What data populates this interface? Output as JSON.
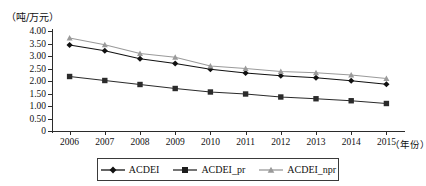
{
  "axes": {
    "y_unit_label": "（吨/万元）",
    "x_axis_label": "（年份）",
    "y_ticks": [
      "4.00",
      "3.50",
      "3.00",
      "2.50",
      "2.00",
      "1.50",
      "1.00",
      "0.50",
      "0"
    ],
    "x_ticks": [
      "2006",
      "2007",
      "2008",
      "2009",
      "2010",
      "2011",
      "2012",
      "2013",
      "2014",
      "2015"
    ]
  },
  "legend": {
    "items": [
      {
        "label": "ACDEI",
        "marker": "diamond-marker",
        "color": "#111111"
      },
      {
        "label": "ACDEI_pr",
        "marker": "square-marker",
        "color": "#2b2b2b"
      },
      {
        "label": "ACDEI_npr",
        "marker": "triangle-marker",
        "color": "#9a9a9a"
      }
    ]
  },
  "chart_data": {
    "type": "line",
    "title": "",
    "xlabel": "（年份）",
    "ylabel": "（吨/万元）",
    "x": [
      2006,
      2007,
      2008,
      2009,
      2010,
      2011,
      2012,
      2013,
      2014,
      2015
    ],
    "categories": [
      "2006",
      "2007",
      "2008",
      "2009",
      "2010",
      "2011",
      "2012",
      "2013",
      "2014",
      "2015"
    ],
    "ylim": [
      0,
      4.0
    ],
    "ytick_values": [
      4.0,
      3.5,
      3.0,
      2.5,
      2.0,
      1.5,
      1.0,
      0.5,
      0
    ],
    "grid": false,
    "legend_position": "bottom",
    "series": [
      {
        "name": "ACDEI",
        "marker": "diamond",
        "color": "#111111",
        "values": [
          3.44,
          3.21,
          2.89,
          2.7,
          2.47,
          2.32,
          2.21,
          2.13,
          2.01,
          1.87
        ]
      },
      {
        "name": "ACDEI_pr",
        "marker": "square",
        "color": "#2b2b2b",
        "values": [
          2.18,
          2.02,
          1.86,
          1.7,
          1.56,
          1.48,
          1.36,
          1.29,
          1.21,
          1.1
        ]
      },
      {
        "name": "ACDEI_npr",
        "marker": "triangle",
        "color": "#9a9a9a",
        "values": [
          3.72,
          3.45,
          3.1,
          2.95,
          2.6,
          2.5,
          2.38,
          2.33,
          2.24,
          2.1
        ]
      }
    ]
  }
}
